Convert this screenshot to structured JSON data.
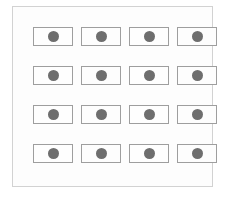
{
  "figure": {
    "name": "flag-grid-diagram",
    "background_color": "#ffffff",
    "frame": {
      "name": "outer-frame",
      "border_color": "#d2d2d2",
      "fill_color": "#fdfdfd"
    },
    "grid": {
      "rows": 4,
      "columns": 4,
      "total_cells": 16,
      "cell": {
        "border_color": "#9e9e9e",
        "fill_color": "#fefefe",
        "width_px": 40,
        "height_px": 19
      },
      "disc": {
        "color": "#6e6e6e",
        "diameter_px": 11,
        "shape": "circle"
      }
    },
    "cells": [
      {
        "id": "cell-r1-c1",
        "row": 1,
        "col": 1,
        "symbol": "circle"
      },
      {
        "id": "cell-r1-c2",
        "row": 1,
        "col": 2,
        "symbol": "circle"
      },
      {
        "id": "cell-r1-c3",
        "row": 1,
        "col": 3,
        "symbol": "circle"
      },
      {
        "id": "cell-r1-c4",
        "row": 1,
        "col": 4,
        "symbol": "circle"
      },
      {
        "id": "cell-r2-c1",
        "row": 2,
        "col": 1,
        "symbol": "circle"
      },
      {
        "id": "cell-r2-c2",
        "row": 2,
        "col": 2,
        "symbol": "circle"
      },
      {
        "id": "cell-r2-c3",
        "row": 2,
        "col": 3,
        "symbol": "circle"
      },
      {
        "id": "cell-r2-c4",
        "row": 2,
        "col": 4,
        "symbol": "circle"
      },
      {
        "id": "cell-r3-c1",
        "row": 3,
        "col": 1,
        "symbol": "circle"
      },
      {
        "id": "cell-r3-c2",
        "row": 3,
        "col": 2,
        "symbol": "circle"
      },
      {
        "id": "cell-r3-c3",
        "row": 3,
        "col": 3,
        "symbol": "circle"
      },
      {
        "id": "cell-r3-c4",
        "row": 3,
        "col": 4,
        "symbol": "circle"
      },
      {
        "id": "cell-r4-c1",
        "row": 4,
        "col": 1,
        "symbol": "circle"
      },
      {
        "id": "cell-r4-c2",
        "row": 4,
        "col": 2,
        "symbol": "circle"
      },
      {
        "id": "cell-r4-c3",
        "row": 4,
        "col": 3,
        "symbol": "circle"
      },
      {
        "id": "cell-r4-c4",
        "row": 4,
        "col": 4,
        "symbol": "circle"
      }
    ]
  }
}
